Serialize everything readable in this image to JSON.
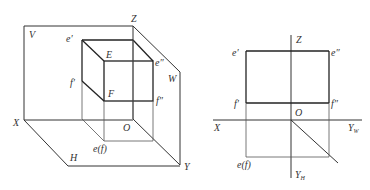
{
  "left_diagram": {
    "title": "3D projection planes with cube",
    "labels": {
      "V": "V",
      "Z": "Z",
      "W": "W",
      "X": "X",
      "Y": "Y",
      "H": "H",
      "O": "O",
      "E": "E",
      "F": "F",
      "e_prime": "e′",
      "f_prime": "f′",
      "e_double_prime": "e″",
      "f_double_prime": "f″",
      "e_f": "e(f)"
    }
  },
  "right_diagram": {
    "title": "Orthographic projection",
    "labels": {
      "Z": "Z",
      "X": "X",
      "O": "O",
      "Y_W": "Y",
      "Y_W_sub": "W",
      "Y_H": "Y",
      "Y_H_sub": "H",
      "e_prime": "e′",
      "f_prime": "f′",
      "e_double_prime": "e″",
      "f_double_prime": "f″",
      "e_f": "e(f)"
    }
  },
  "colors": {
    "line": "#333333",
    "background": "#ffffff"
  }
}
